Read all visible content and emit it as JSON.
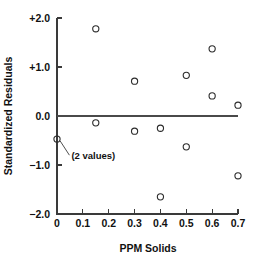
{
  "chart_data": {
    "type": "scatter",
    "title": "",
    "xlabel": "PPM Solids",
    "ylabel": "Standardized Residuals",
    "xlim": [
      0,
      0.7
    ],
    "ylim": [
      -2.0,
      2.0
    ],
    "grid": false,
    "legend": null,
    "reference_lines": [
      {
        "axis": "y",
        "value": 0.0
      }
    ],
    "xticks": [
      0,
      0.1,
      0.2,
      0.3,
      0.4,
      0.5,
      0.6,
      0.7
    ],
    "xtick_labels": [
      "0",
      "0.1",
      "0.2",
      "0.3",
      "0.4",
      "0.5",
      "0.6",
      "0.7"
    ],
    "yticks": [
      -2.0,
      -1.0,
      0.0,
      1.0,
      2.0
    ],
    "ytick_labels": [
      "−2.0",
      "−1.0",
      "0.0",
      "+1.0",
      "+2.0"
    ],
    "marker_style": "open-circle",
    "marker_color": "#2b2b2b",
    "points": [
      {
        "x": 0.0,
        "y": -0.47,
        "note": "2 values"
      },
      {
        "x": 0.15,
        "y": 1.78,
        "note": ""
      },
      {
        "x": 0.15,
        "y": -0.14,
        "note": ""
      },
      {
        "x": 0.3,
        "y": 0.71,
        "note": ""
      },
      {
        "x": 0.3,
        "y": -0.31,
        "note": ""
      },
      {
        "x": 0.4,
        "y": -0.25,
        "note": ""
      },
      {
        "x": 0.4,
        "y": -1.65,
        "note": ""
      },
      {
        "x": 0.5,
        "y": 0.83,
        "note": ""
      },
      {
        "x": 0.5,
        "y": -0.63,
        "note": ""
      },
      {
        "x": 0.6,
        "y": 1.37,
        "note": ""
      },
      {
        "x": 0.6,
        "y": 0.41,
        "note": ""
      },
      {
        "x": 0.7,
        "y": 0.22,
        "note": ""
      },
      {
        "x": 0.7,
        "y": -1.22,
        "note": ""
      }
    ],
    "annotations": [
      {
        "text": "(2 values)",
        "target_x": 0.0,
        "target_y": -0.47,
        "label_x": 0.048,
        "label_y": -0.8
      }
    ]
  }
}
